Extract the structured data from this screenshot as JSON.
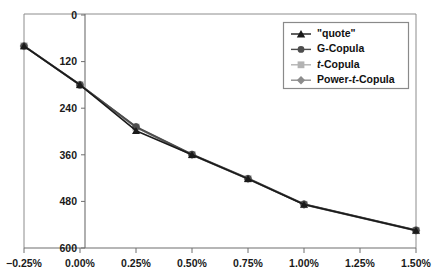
{
  "chart_data": {
    "type": "line",
    "title": "",
    "xlabel": "",
    "ylabel": "",
    "x": [
      "-0.25%",
      "0.00%",
      "0.25%",
      "0.50%",
      "0.75%",
      "1.00%",
      "1.50%"
    ],
    "x_numeric": [
      -0.25,
      0.0,
      0.25,
      0.5,
      0.75,
      1.0,
      1.5
    ],
    "xlim": [
      -0.25,
      1.5
    ],
    "ylim": [
      0,
      600
    ],
    "y_ticks": [
      0,
      120,
      240,
      360,
      480,
      600
    ],
    "x_ticks": [
      "-0.25%",
      "0.00%",
      "0.25%",
      "0.50%",
      "0.75%",
      "1.00%",
      "1.50%"
    ],
    "grid": false,
    "legend_position": "top-right",
    "series": [
      {
        "name": "\"quote\"",
        "marker": "triangle",
        "color": "#1a1a1a",
        "values": [
          520,
          420,
          302,
          240,
          178,
          112,
          45
        ]
      },
      {
        "name": "G-Copula",
        "marker": "circle",
        "color": "#4d4d4d",
        "values": [
          520,
          420,
          312,
          241,
          179,
          113,
          46
        ]
      },
      {
        "name": "t-Copula",
        "marker": "square",
        "color": "#b3b3b3",
        "values": [
          520,
          420,
          311,
          240,
          178,
          112,
          45
        ]
      },
      {
        "name": "Power-t-Copula",
        "marker": "diamond",
        "color": "#8c8c8c",
        "values": [
          520,
          420,
          311,
          240,
          178,
          112,
          45
        ]
      }
    ]
  },
  "legend": {
    "items": [
      {
        "label": "\"quote\"",
        "marker": "triangle-icon"
      },
      {
        "label": "G-Copula",
        "marker": "circle-icon"
      },
      {
        "label": "t-Copula",
        "marker": "square-icon",
        "italic_prefix": "t",
        "rest": "-Copula"
      },
      {
        "label": "Power-t-Copula",
        "marker": "diamond-icon",
        "pre": "Power-",
        "italic_prefix": "t",
        "rest": "-Copula"
      }
    ]
  },
  "axis": {
    "y_labels": [
      "600",
      "480",
      "360",
      "240",
      "120",
      "0"
    ],
    "x_labels": [
      "−0.25%",
      "0.00%",
      "0.25%",
      "0.50%",
      "0.75%",
      "1.00%",
      "1.50%"
    ]
  },
  "colors": {
    "quote": "#1a1a1a",
    "g_copula": "#4d4d4d",
    "t_copula": "#b3b3b3",
    "power_t_copula": "#8c8c8c",
    "axis": "#6e6e6e",
    "frame": "#8c8c8c",
    "background": "#ffffff"
  }
}
